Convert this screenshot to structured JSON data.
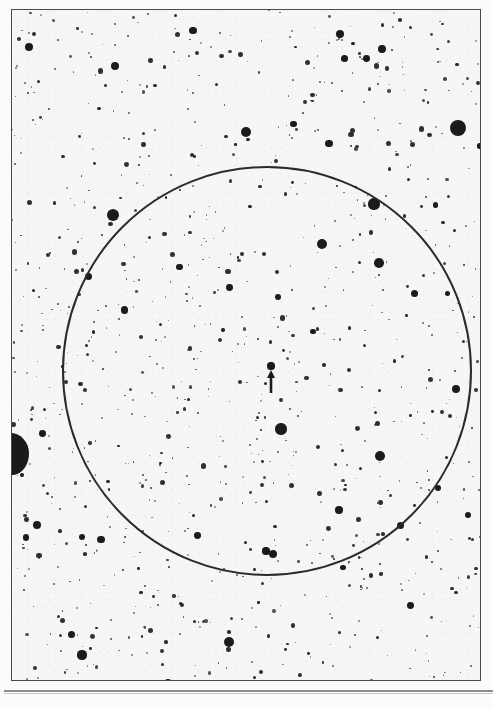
{
  "document": {
    "type": "astronomical-finder-chart",
    "title": "",
    "caption": ""
  },
  "frame": {
    "x": 11,
    "y": 9,
    "width": 470,
    "height": 672,
    "border_color": "#4a4a4a",
    "background_color": "#f6f6f4"
  },
  "fov_circle": {
    "label": "field-of-view circle",
    "center_x": 266,
    "center_y": 370,
    "radius": 204,
    "stroke_color": "#2b2b2b",
    "stroke_width": 2.0
  },
  "target_marker": {
    "label": "arrow marker",
    "shape": "up-arrow",
    "tip_x": 270,
    "tip_y": 368,
    "tail_y": 392,
    "color": "#1b1b1b",
    "points_to": "target star"
  },
  "target_star": {
    "x": 270,
    "y": 365,
    "radius": 3.6
  },
  "edge_artifact": {
    "label": "plate edge blob",
    "x": -8,
    "y": 432,
    "width": 36,
    "height": 42,
    "color": "#1b1b1b"
  },
  "baseline_rule": {
    "x": 4,
    "y": 690,
    "width": 489,
    "color": "#8d8d8d"
  },
  "chart_data": {
    "type": "scatter",
    "title": "",
    "xlabel": "",
    "ylabel": "",
    "xlim": [
      0,
      493
    ],
    "ylim": [
      0,
      709
    ],
    "grid": false,
    "legend": null,
    "bright_stars": [
      {
        "x": 457,
        "y": 127,
        "r": 8.0
      },
      {
        "x": 14,
        "y": 452,
        "r": 13.0
      },
      {
        "x": 112,
        "y": 214,
        "r": 6.2
      },
      {
        "x": 373,
        "y": 203,
        "r": 5.6
      },
      {
        "x": 321,
        "y": 243,
        "r": 5.0
      },
      {
        "x": 378,
        "y": 262,
        "r": 4.8
      },
      {
        "x": 379,
        "y": 455,
        "r": 5.4
      },
      {
        "x": 280,
        "y": 428,
        "r": 5.6
      },
      {
        "x": 245,
        "y": 131,
        "r": 5.0
      },
      {
        "x": 228,
        "y": 641,
        "r": 5.2
      },
      {
        "x": 81,
        "y": 654,
        "r": 4.6
      },
      {
        "x": 166,
        "y": 686,
        "r": 4.6
      },
      {
        "x": 167,
        "y": 682,
        "r": 4.0
      },
      {
        "x": 455,
        "y": 388,
        "r": 4.4
      },
      {
        "x": 114,
        "y": 65,
        "r": 4.2
      },
      {
        "x": 339,
        "y": 33,
        "r": 4.0
      },
      {
        "x": 36,
        "y": 524,
        "r": 4.0
      },
      {
        "x": 272,
        "y": 553,
        "r": 4.4
      },
      {
        "x": 265,
        "y": 550,
        "r": 3.6
      }
    ],
    "star_count_estimate": 980,
    "seed": 20240517
  }
}
